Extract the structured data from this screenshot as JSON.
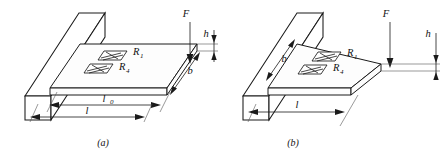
{
  "figure": {
    "background_color": "#ffffff",
    "line_color": "#1a1a1a"
  },
  "panels": [
    {
      "id": "a",
      "caption": "(a)",
      "beam_type": "constant-width rectangular cantilever beam",
      "force_label": "F",
      "gauges": [
        {
          "label": "R",
          "subscript": "1"
        },
        {
          "label": "R",
          "subscript": "4"
        }
      ],
      "dimensions": [
        {
          "label": "l",
          "subscript": "0",
          "orientation": "horizontal",
          "note": "upper length dimension"
        },
        {
          "label": "l",
          "subscript": "",
          "orientation": "horizontal",
          "note": "lower length dimension"
        },
        {
          "label": "b",
          "subscript": "",
          "orientation": "diagonal",
          "note": "beam width at free end"
        },
        {
          "label": "h",
          "subscript": "",
          "orientation": "vertical",
          "note": "beam thickness"
        }
      ]
    },
    {
      "id": "b",
      "caption": "(b)",
      "beam_type": "tapered triangular constant-strength cantilever beam",
      "force_label": "F",
      "gauges": [
        {
          "label": "R",
          "subscript": "1"
        },
        {
          "label": "R",
          "subscript": "4"
        }
      ],
      "dimensions": [
        {
          "label": "l",
          "subscript": "",
          "orientation": "horizontal",
          "note": "beam length dimension"
        },
        {
          "label": "b",
          "subscript": "",
          "orientation": "diagonal",
          "note": "beam width at fixed end"
        },
        {
          "label": "h",
          "subscript": "",
          "orientation": "vertical",
          "note": "beam thickness"
        }
      ]
    }
  ]
}
